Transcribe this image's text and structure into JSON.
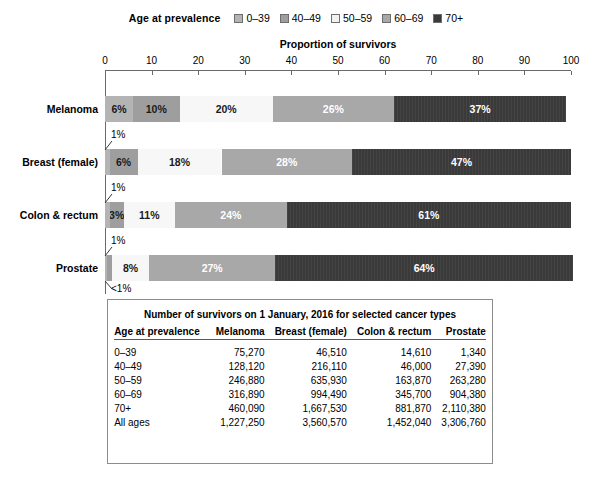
{
  "legend": {
    "title": "Age at prevalence",
    "entries": [
      {
        "label": "0–39",
        "color": "#b4b4b4"
      },
      {
        "label": "40–49",
        "color": "#9e9e9e"
      },
      {
        "label": "50–59",
        "color": "#f2f2f2"
      },
      {
        "label": "60–69",
        "color": "#a8a8a8"
      },
      {
        "label": "70+",
        "color": "#3a3a3a"
      }
    ]
  },
  "chart_data": {
    "type": "bar",
    "orientation": "horizontal",
    "stacked": true,
    "title": "",
    "xlabel": "Proportion of survivors",
    "ylabel": "",
    "xlim": [
      0,
      100
    ],
    "xticks": [
      0,
      10,
      20,
      30,
      40,
      50,
      60,
      70,
      80,
      90,
      100
    ],
    "grid": false,
    "legend_position": "top-center",
    "categories": [
      "Melanoma",
      "Breast (female)",
      "Colon & rectum",
      "Prostate"
    ],
    "series": [
      {
        "name": "0–39",
        "values": [
          6,
          1,
          1,
          0.5
        ]
      },
      {
        "name": "40–49",
        "values": [
          10,
          6,
          3,
          1
        ]
      },
      {
        "name": "50–59",
        "values": [
          20,
          18,
          11,
          8
        ]
      },
      {
        "name": "60–69",
        "values": [
          26,
          28,
          24,
          27
        ]
      },
      {
        "name": "70+",
        "values": [
          37,
          47,
          61,
          64
        ]
      }
    ],
    "bars": [
      {
        "category": "Melanoma",
        "segments": [
          {
            "age": "0–39",
            "value": 6,
            "label": "6%",
            "label_inside": true,
            "style": "0039"
          },
          {
            "age": "40–49",
            "value": 10,
            "label": "10%",
            "label_inside": true,
            "style": "4049"
          },
          {
            "age": "50–59",
            "value": 20,
            "label": "20%",
            "label_inside": true,
            "style": "5059"
          },
          {
            "age": "60–69",
            "value": 26,
            "label": "26%",
            "label_inside": true,
            "style": "6069"
          },
          {
            "age": "70+",
            "value": 37,
            "label": "37%",
            "label_inside": true,
            "style": "70"
          }
        ],
        "callouts": []
      },
      {
        "category": "Breast (female)",
        "segments": [
          {
            "age": "0–39",
            "value": 1,
            "label": "1%",
            "label_inside": false,
            "style": "0039"
          },
          {
            "age": "40–49",
            "value": 6,
            "label": "6%",
            "label_inside": true,
            "style": "4049"
          },
          {
            "age": "50–59",
            "value": 18,
            "label": "18%",
            "label_inside": true,
            "style": "5059"
          },
          {
            "age": "60–69",
            "value": 28,
            "label": "28%",
            "label_inside": true,
            "style": "6069"
          },
          {
            "age": "70+",
            "value": 47,
            "label": "47%",
            "label_inside": true,
            "style": "70"
          }
        ],
        "callouts": [
          {
            "text": "1%",
            "position": "above-left"
          }
        ]
      },
      {
        "category": "Colon & rectum",
        "segments": [
          {
            "age": "0–39",
            "value": 1,
            "label": "1%",
            "label_inside": false,
            "style": "0039"
          },
          {
            "age": "40–49",
            "value": 3,
            "label": "3%",
            "label_inside": true,
            "style": "4049"
          },
          {
            "age": "50–59",
            "value": 11,
            "label": "11%",
            "label_inside": true,
            "style": "5059"
          },
          {
            "age": "60–69",
            "value": 24,
            "label": "24%",
            "label_inside": true,
            "style": "6069"
          },
          {
            "age": "70+",
            "value": 61,
            "label": "61%",
            "label_inside": true,
            "style": "70"
          }
        ],
        "callouts": [
          {
            "text": "1%",
            "position": "above-left"
          }
        ]
      },
      {
        "category": "Prostate",
        "segments": [
          {
            "age": "0–39",
            "value": 0.5,
            "label": "<1%",
            "label_inside": false,
            "style": "0039"
          },
          {
            "age": "40–49",
            "value": 1,
            "label": "1%",
            "label_inside": false,
            "style": "4049"
          },
          {
            "age": "50–59",
            "value": 8,
            "label": "8%",
            "label_inside": true,
            "style": "5059"
          },
          {
            "age": "60–69",
            "value": 27,
            "label": "27%",
            "label_inside": true,
            "style": "6069"
          },
          {
            "age": "70+",
            "value": 64,
            "label": "64%",
            "label_inside": true,
            "style": "70"
          }
        ],
        "callouts": [
          {
            "text": "1%",
            "position": "above-left"
          },
          {
            "text": "<1%",
            "position": "below-left"
          }
        ]
      }
    ]
  },
  "table": {
    "caption": "Number of survivors on 1 January, 2016 for selected cancer types",
    "columns": [
      "Age at prevalence",
      "Melanoma",
      "Breast (female)",
      "Colon & rectum",
      "Prostate"
    ],
    "rows": [
      {
        "age": "0–39",
        "melanoma": "75,270",
        "breast": "46,510",
        "colon": "14,610",
        "prostate": "1,340"
      },
      {
        "age": "40–49",
        "melanoma": "128,120",
        "breast": "216,110",
        "colon": "46,000",
        "prostate": "27,390"
      },
      {
        "age": "50–59",
        "melanoma": "246,880",
        "breast": "635,930",
        "colon": "163,870",
        "prostate": "263,280"
      },
      {
        "age": "60–69",
        "melanoma": "316,890",
        "breast": "994,490",
        "colon": "345,700",
        "prostate": "904,380"
      },
      {
        "age": "70+",
        "melanoma": "460,090",
        "breast": "1,667,530",
        "colon": "881,870",
        "prostate": "2,110,380"
      },
      {
        "age": "All ages",
        "melanoma": "1,227,250",
        "breast": "3,560,570",
        "colon": "1,452,040",
        "prostate": "3,306,760"
      }
    ]
  }
}
